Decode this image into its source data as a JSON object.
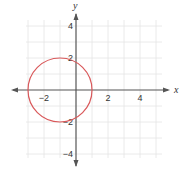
{
  "chart_data": {
    "type": "line",
    "title": "",
    "xlabel": "x",
    "ylabel": "y",
    "xlim": [
      -3,
      5
    ],
    "ylim": [
      -4,
      4
    ],
    "grid": true,
    "x_ticks": [
      -2,
      2,
      4
    ],
    "y_ticks": [
      4,
      2,
      -2,
      -4
    ],
    "x_tick_labels": [
      "−2",
      "2",
      "4"
    ],
    "y_tick_labels": [
      "4",
      "2",
      "−2",
      "−4"
    ],
    "series": [
      {
        "name": "circle",
        "shape": "circle",
        "center": [
          -1,
          0
        ],
        "radius": 2,
        "equation": "(x + 1)^2 + y^2 = 4",
        "color": "#d9585a"
      }
    ]
  },
  "colors": {
    "grid": "#e4e4e4",
    "axis": "#555555",
    "curve": "#d9585a"
  }
}
